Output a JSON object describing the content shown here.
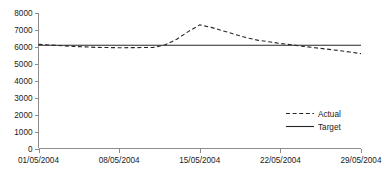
{
  "chart_data": {
    "type": "line",
    "title": "",
    "xlabel": "",
    "ylabel": "",
    "grid": false,
    "legend_position": "bottom-right",
    "x": [
      "01/05/2004",
      "02/05/2004",
      "03/05/2004",
      "04/05/2004",
      "05/05/2004",
      "06/05/2004",
      "07/05/2004",
      "08/05/2004",
      "09/05/2004",
      "10/05/2004",
      "11/05/2004",
      "12/05/2004",
      "13/05/2004",
      "14/05/2004",
      "15/05/2004",
      "16/05/2004",
      "17/05/2004",
      "18/05/2004",
      "19/05/2004",
      "20/05/2004",
      "21/05/2004",
      "22/05/2004",
      "23/05/2004",
      "24/05/2004",
      "25/05/2004",
      "26/05/2004",
      "27/05/2004",
      "28/05/2004",
      "29/05/2004"
    ],
    "xticks": [
      "01/05/2004",
      "08/05/2004",
      "15/05/2004",
      "22/05/2004",
      "29/05/2004"
    ],
    "xtick_positions": [
      0,
      7,
      14,
      21,
      28
    ],
    "yticks": [
      0,
      1000,
      2000,
      3000,
      4000,
      5000,
      6000,
      7000,
      8000
    ],
    "ytick_labels": [
      "0",
      "1000",
      "2000",
      "3000",
      "4000",
      "5000",
      "6000",
      "7000",
      "8000"
    ],
    "ylim": [
      0,
      8000
    ],
    "series": [
      {
        "name": "Actual",
        "style": "dashed",
        "color": "#262626",
        "values": [
          6150,
          6110,
          6070,
          6030,
          6000,
          5970,
          5960,
          5950,
          5955,
          5960,
          5970,
          6120,
          6450,
          6900,
          7300,
          7150,
          6950,
          6750,
          6550,
          6400,
          6300,
          6200,
          6120,
          6030,
          5950,
          5870,
          5790,
          5700,
          5600
        ]
      },
      {
        "name": "Target",
        "style": "solid",
        "color": "#262626",
        "values": [
          6100,
          6100,
          6100,
          6100,
          6100,
          6100,
          6100,
          6100,
          6100,
          6100,
          6100,
          6100,
          6100,
          6100,
          6100,
          6100,
          6100,
          6100,
          6100,
          6100,
          6100,
          6100,
          6100,
          6100,
          6100,
          6100,
          6100,
          6100,
          6100
        ]
      }
    ]
  },
  "legend": {
    "items": [
      {
        "label": "Actual"
      },
      {
        "label": "Target"
      }
    ]
  },
  "colors": {
    "axis": "#8c8c8c",
    "series": "#262626",
    "background": "#ffffff"
  }
}
